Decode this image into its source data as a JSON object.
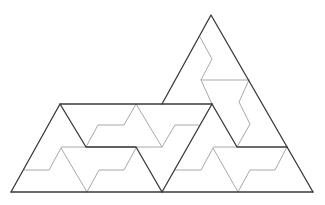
{
  "diagram": {
    "type": "geometric-dissection",
    "colors": {
      "outline": "#3a3a3a",
      "dissection": "#a8a8a8",
      "background": "#ffffff"
    },
    "outline_paths": [
      "M11,192 L313,192",
      "M11,192 L60,104 L212,104",
      "M162,104 L211,15 L313,192",
      "M60,104 L86,147 L136,147 L162,192",
      "M212,104 L162,192",
      "M212,104 L237,147 L287,147"
    ],
    "dissection_paths": [
      "M86,147 L98,125 L124,125 L136,104 L162,147 L86,147",
      "M162,147 L175,125 L199,125",
      "M24,170 L49,170 L61,148 L87,192",
      "M61,147 L86,147",
      "M87,192 L99,170 L124,170 L136,148",
      "M175,170 L201,170 L213,148 L238,192",
      "M213,147 L237,147",
      "M238,192 L250,170 L275,170 L287,147",
      "M200,37 L212,59 L201,80 L249,80",
      "M201,80 L212,104",
      "M249,80 L239,102 L250,124 L237,147"
    ]
  }
}
